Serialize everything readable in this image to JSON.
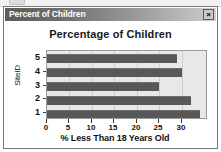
{
  "window": {
    "title": "Percent of Children",
    "close_label": "×",
    "close_icon": "close-icon"
  },
  "chart_data": {
    "type": "bar",
    "orientation": "horizontal",
    "title": "Percentage of Children",
    "xlabel": "% Less Than 18 Years Old",
    "ylabel": "SiteID",
    "categories": [
      "1",
      "2",
      "3",
      "4",
      "5"
    ],
    "values": [
      34,
      32,
      25,
      30,
      29
    ],
    "xlim": [
      0,
      35.8
    ],
    "xticks": [
      0,
      5,
      10,
      15,
      20,
      25,
      30
    ],
    "xtick_labels": [
      "0",
      "5",
      "10",
      "15",
      "20",
      "25",
      "30"
    ],
    "ytick_labels_top_to_bottom": [
      "5",
      "4",
      "3",
      "2",
      "1"
    ],
    "grid": true,
    "legend": false,
    "bar_color": "#585858",
    "plot_background": "#e8e8e8"
  }
}
